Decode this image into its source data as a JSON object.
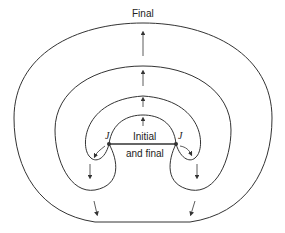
{
  "diagram": {
    "labels": {
      "final_top": "Final",
      "initial_line1": "Initial",
      "initial_line2": "and final",
      "junction_left": "J",
      "junction_right": "J"
    },
    "colors": {
      "stroke": "#333333",
      "background": "#ffffff"
    }
  }
}
